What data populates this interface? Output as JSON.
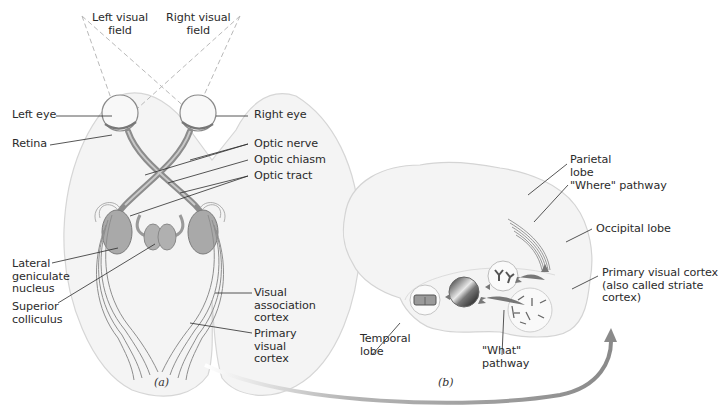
{
  "panel_a": {
    "caption": "(a)",
    "labels": {
      "left_visual_field": "Left visual\nfield",
      "right_visual_field": "Right visual\nfield",
      "left_eye": "Left eye",
      "right_eye": "Right eye",
      "retina": "Retina",
      "optic_nerve": "Optic nerve",
      "optic_chiasm": "Optic chiasm",
      "optic_tract": "Optic tract",
      "lateral_geniculate_nucleus": "Lateral\ngeniculate\nnucleus",
      "superior_colliculus": "Superior\ncolliculus",
      "visual_association_cortex": "Visual\nassociation\ncortex",
      "primary_visual_cortex": "Primary\nvisual\ncortex"
    }
  },
  "panel_b": {
    "caption": "(b)",
    "labels": {
      "parietal_lobe": "Parietal\nlobe",
      "where_pathway": "\"Where\" pathway",
      "occipital_lobe": "Occipital lobe",
      "primary_visual_cortex": "Primary visual cortex\n(also called striate\ncortex)",
      "temporal_lobe": "Temporal\nlobe",
      "what_pathway": "\"What\"\npathway"
    }
  },
  "colors": {
    "brain_fill": "#f3f3f3",
    "brain_outline": "#d4d4d4",
    "tract": "#8c8c8c",
    "nucleus": "#a8a8a8",
    "leader": "#2b2b2b",
    "arrow": "#9a9a9a"
  }
}
